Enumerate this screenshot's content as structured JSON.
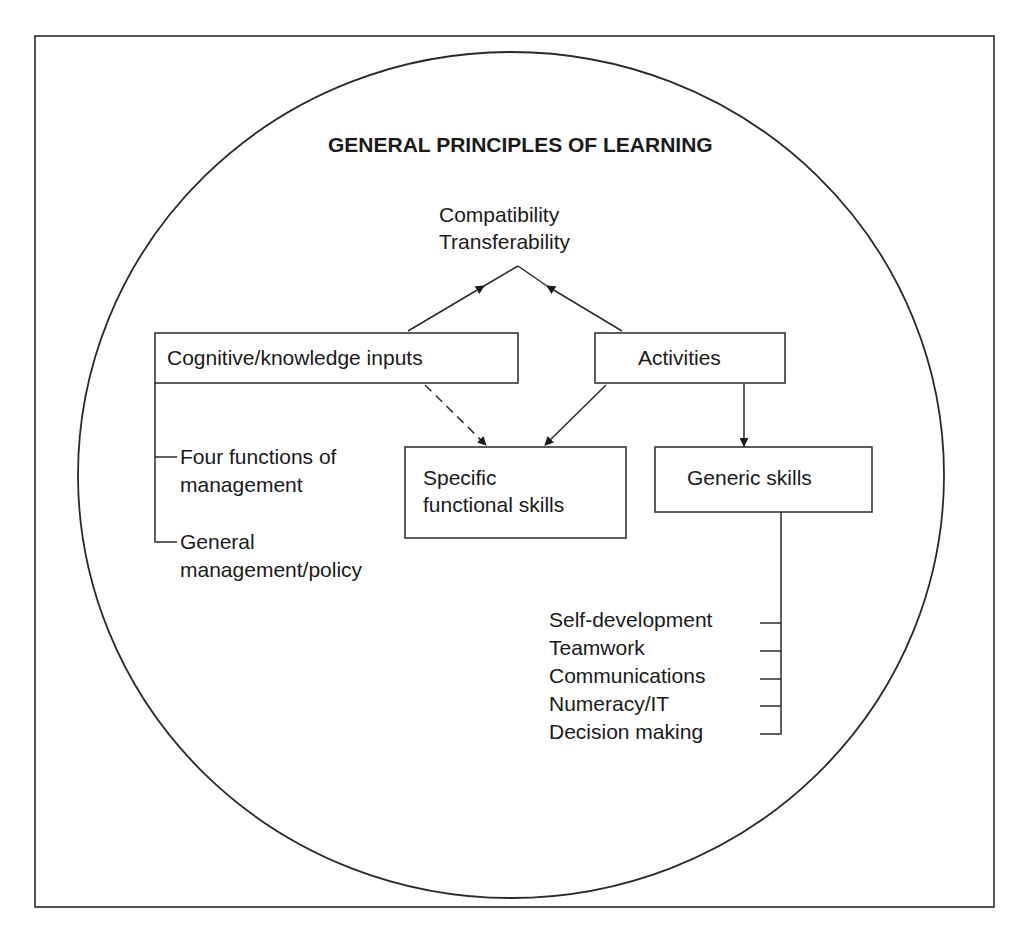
{
  "diagram": {
    "title": "GENERAL PRINCIPLES OF LEARNING",
    "outcome": {
      "line1": "Compatibility",
      "line2": "Transferability"
    },
    "nodes": {
      "cognitive": "Cognitive/knowledge inputs",
      "activities": "Activities",
      "specific": {
        "line1": "Specific",
        "line2": "functional skills"
      },
      "generic": "Generic skills"
    },
    "cognitive_branches": [
      {
        "line1": "Four functions of",
        "line2": "management"
      },
      {
        "line1": "General",
        "line2": "management/policy"
      }
    ],
    "generic_branches": [
      "Self-development",
      "Teamwork",
      "Communications",
      "Numeracy/IT",
      "Decision making"
    ],
    "edges": [
      {
        "from": "cognitive",
        "to": "outcome",
        "style": "solid-arrow"
      },
      {
        "from": "activities",
        "to": "outcome",
        "style": "solid-arrow"
      },
      {
        "from": "cognitive",
        "to": "specific",
        "style": "dashed-arrow"
      },
      {
        "from": "activities",
        "to": "specific",
        "style": "solid-arrow"
      },
      {
        "from": "activities",
        "to": "generic",
        "style": "solid-arrow"
      }
    ],
    "colors": {
      "stroke": "#2a2a2a",
      "text": "#1a1a1a",
      "background": "#ffffff"
    }
  }
}
